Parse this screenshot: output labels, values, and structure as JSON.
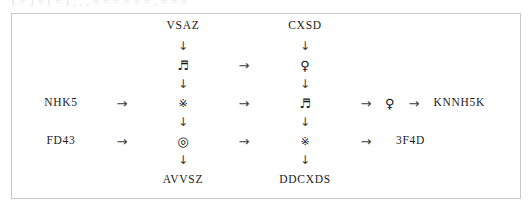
{
  "clipped_top_line": {
    "text": "( = )   =  ( = ) ,   ,  ,   =  = =   =   = = ,  =   = ="
  },
  "diagram": {
    "type": "flow-chain-grid",
    "border_color": "#c9c9c9",
    "background_color": "#ffffff",
    "icons": {
      "arrow_right": "→",
      "arrow_down": "↓",
      "music_note": "♬",
      "venus": "♀",
      "reference_mark": "※",
      "bullseye": "◎"
    },
    "icon_names": {
      "arrow_right": "arrow-right-icon",
      "arrow_down": "arrow-down-icon",
      "music_note": "music-note-icon",
      "venus": "venus-symbol-icon",
      "reference_mark": "reference-mark-icon",
      "bullseye": "bullseye-icon"
    },
    "labels": {
      "top_left": "VSAZ",
      "top_right": "CXSD",
      "left_middle": "NHK5",
      "left_bottom": "FD43",
      "right_middle": "KNNH5K",
      "right_bottom": "3F4D",
      "bottom_left": "AVVSZ",
      "bottom_right": "DDCXDS"
    },
    "nodes": {
      "col3_row3": "♬",
      "col5_row3": "♀",
      "col3_row5": "※",
      "col5_row5": "♬",
      "col3_row7": "◎",
      "col5_row7": "※"
    },
    "chains": {
      "vertical_left": [
        "VSAZ",
        "♬",
        "※",
        "◎",
        "AVVSZ"
      ],
      "vertical_right": [
        "CXSD",
        "♀",
        "♬",
        "※",
        "DDCXDS"
      ],
      "horizontal_top": [
        "♬",
        "♀"
      ],
      "horizontal_middle": [
        "NHK5",
        "※",
        "♬",
        "♀",
        "KNNH5K"
      ],
      "horizontal_bottom": [
        "FD43",
        "◎",
        "※",
        "3F4D"
      ]
    }
  }
}
